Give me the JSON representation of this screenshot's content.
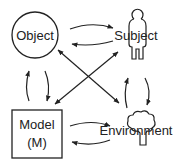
{
  "diagram": {
    "nodes": {
      "object": {
        "label": "Object",
        "shape": "circle"
      },
      "subject": {
        "label": "Subject",
        "shape": "person-icon"
      },
      "model": {
        "label_line1": "Model",
        "label_line2": "(M)",
        "shape": "rectangle"
      },
      "environment": {
        "label": "Environment",
        "shape": "tree-icon"
      }
    },
    "edges": [
      {
        "from": "object",
        "to": "subject"
      },
      {
        "from": "subject",
        "to": "object"
      },
      {
        "from": "model",
        "to": "environment"
      },
      {
        "from": "environment",
        "to": "model"
      },
      {
        "from": "model",
        "to": "object"
      },
      {
        "from": "object",
        "to": "model"
      },
      {
        "from": "environment",
        "to": "subject"
      },
      {
        "from": "subject",
        "to": "environment"
      },
      {
        "from": "model",
        "to": "subject"
      },
      {
        "from": "subject",
        "to": "model"
      },
      {
        "from": "object",
        "to": "environment"
      },
      {
        "from": "environment",
        "to": "object"
      }
    ],
    "colors": {
      "line": "#222222",
      "background": "#ffffff"
    }
  }
}
